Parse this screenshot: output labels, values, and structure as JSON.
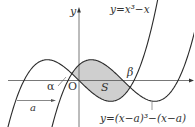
{
  "diagram": {
    "type": "function-graph",
    "colors": {
      "curve": "#2b2b2b",
      "axis": "#555555",
      "shade": "#cfcfcf",
      "text": "#333333"
    },
    "axes": {
      "x_label": "x",
      "y_label": "y",
      "origin_label": "O"
    },
    "curve1": {
      "label": "y=x³−x",
      "equation": "x^3 - x"
    },
    "curve2": {
      "label": "y=(x−a)³−(x−a)",
      "equation": "(x-a)^3 - (x-a)"
    },
    "shift_label": "a",
    "intersection_labels": {
      "alpha": "α",
      "beta": "β"
    },
    "region_label": "S"
  },
  "labels": {
    "y": "y",
    "O": "O",
    "alpha": "α",
    "beta": "β",
    "S": "S",
    "a": "a",
    "curve1": "y=x³−x",
    "curve2": "y=(x−a)³−(x−a)"
  }
}
